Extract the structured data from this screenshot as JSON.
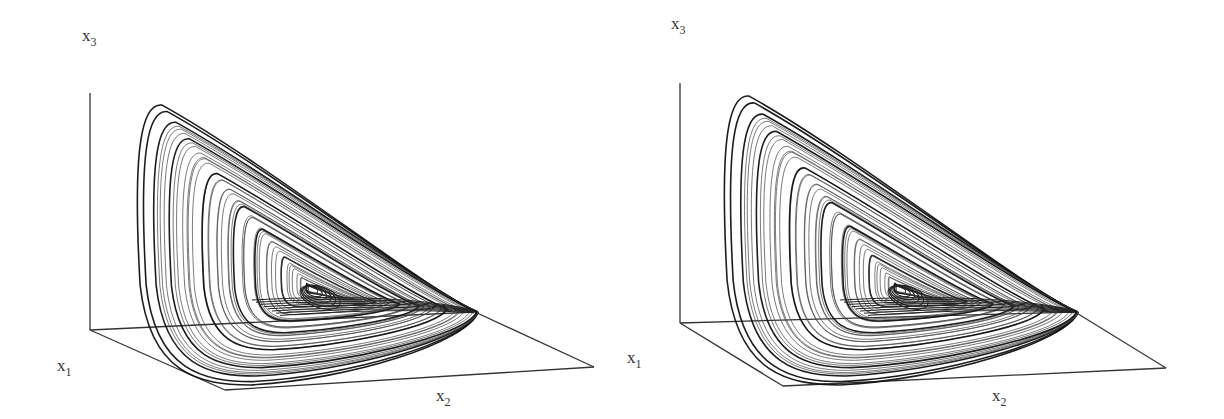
{
  "figure": {
    "panels": [
      {
        "id": "left",
        "labels": {
          "x1": "x",
          "x1_sub": "1",
          "x2": "x",
          "x2_sub": "2",
          "x3": "x",
          "x3_sub": "3"
        }
      },
      {
        "id": "right",
        "labels": {
          "x1": "x",
          "x1_sub": "1",
          "x2": "x",
          "x2_sub": "2",
          "x3": "x",
          "x3_sub": "3"
        }
      }
    ]
  },
  "chart_data": [
    {
      "type": "line",
      "title": "",
      "description": "3D phase-space trajectory of a chaotic (Rossler-type) attractor, left view",
      "axes": [
        "x1",
        "x2",
        "x3"
      ],
      "xlabel": "x2",
      "ylabel": "x3",
      "zlabel": "x1",
      "grid": false,
      "legend": null,
      "line_color": "#222222",
      "box": {
        "origin": [
          90,
          330
        ],
        "x3_top": [
          90,
          93
        ],
        "front_corner": [
          225,
          390
        ],
        "right_corner": [
          594,
          367
        ],
        "back_end": [
          475,
          312
        ]
      },
      "attractor": {
        "outer_top": [
          150,
          105
        ],
        "vortex_center": [
          312,
          290
        ],
        "bottom": [
          230,
          385
        ],
        "tip": [
          478,
          312
        ]
      }
    },
    {
      "type": "line",
      "title": "",
      "description": "3D phase-space trajectory of a chaotic (Rossler-type) attractor, right view",
      "axes": [
        "x1",
        "x2",
        "x3"
      ],
      "xlabel": "x2",
      "ylabel": "x3",
      "zlabel": "x1",
      "grid": false,
      "legend": null,
      "line_color": "#222222",
      "box": {
        "origin": [
          680,
          323
        ],
        "x3_top": [
          680,
          83
        ],
        "front_corner": [
          783,
          386
        ],
        "right_corner": [
          1166,
          368
        ],
        "back_end": [
          1075,
          312
        ]
      },
      "attractor": {
        "outer_top": [
          737,
          96
        ],
        "vortex_center": [
          900,
          290
        ],
        "bottom": [
          820,
          385
        ],
        "tip": [
          1078,
          312
        ]
      }
    }
  ]
}
